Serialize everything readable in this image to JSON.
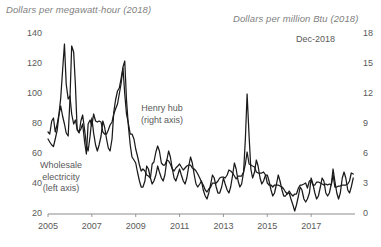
{
  "chart_data": {
    "type": "line",
    "title": "",
    "left_axis": {
      "label": "Dollars per megawatt-hour (2018)",
      "ticks": [
        20,
        40,
        60,
        80,
        100,
        120,
        140
      ],
      "ylim": [
        20,
        140
      ]
    },
    "right_axis": {
      "label": "Dollars per million Btu (2018)",
      "ticks": [
        0,
        3,
        6,
        9,
        12,
        15,
        18
      ],
      "ylim": [
        0,
        18
      ]
    },
    "xlabel": "",
    "x_ticks": [
      "2005",
      "2007",
      "2009",
      "2011",
      "2013",
      "2015",
      "2017"
    ],
    "xlim": [
      2005,
      2019
    ],
    "grid": false,
    "legend_position": "inline-annotations",
    "annotations": [
      {
        "name": "henry-hub",
        "line1": "Henry hub",
        "line2": "(right axis)"
      },
      {
        "name": "wholesale-electricity",
        "line1": "Wholesale",
        "line2": "electricity",
        "line3": "(left axis)"
      },
      {
        "name": "end-date-stamp",
        "text": "Dec-2018"
      }
    ],
    "series": [
      {
        "name": "Wholesale electricity",
        "axis": "left",
        "units": "Dollars per megawatt-hour (2018)",
        "color": "#1a1a1a",
        "x": [
          2005.0,
          2005.08,
          2005.17,
          2005.25,
          2005.33,
          2005.42,
          2005.5,
          2005.58,
          2005.67,
          2005.75,
          2005.83,
          2005.92,
          2006.0,
          2006.08,
          2006.17,
          2006.25,
          2006.33,
          2006.42,
          2006.5,
          2006.58,
          2006.67,
          2006.75,
          2006.83,
          2006.92,
          2007.0,
          2007.08,
          2007.17,
          2007.25,
          2007.33,
          2007.42,
          2007.5,
          2007.58,
          2007.67,
          2007.75,
          2007.83,
          2007.92,
          2008.0,
          2008.08,
          2008.17,
          2008.25,
          2008.33,
          2008.42,
          2008.5,
          2008.58,
          2008.67,
          2008.75,
          2008.83,
          2008.92,
          2009.0,
          2009.08,
          2009.17,
          2009.25,
          2009.33,
          2009.42,
          2009.5,
          2009.58,
          2009.67,
          2009.75,
          2009.83,
          2009.92,
          2010.0,
          2010.08,
          2010.17,
          2010.25,
          2010.33,
          2010.42,
          2010.5,
          2010.58,
          2010.67,
          2010.75,
          2010.83,
          2010.92,
          2011.0,
          2011.08,
          2011.17,
          2011.25,
          2011.33,
          2011.42,
          2011.5,
          2011.58,
          2011.67,
          2011.75,
          2011.83,
          2011.92,
          2012.0,
          2012.08,
          2012.17,
          2012.25,
          2012.33,
          2012.42,
          2012.5,
          2012.58,
          2012.67,
          2012.75,
          2012.83,
          2012.92,
          2013.0,
          2013.08,
          2013.17,
          2013.25,
          2013.33,
          2013.42,
          2013.5,
          2013.58,
          2013.67,
          2013.75,
          2013.83,
          2013.92,
          2014.0,
          2014.08,
          2014.17,
          2014.25,
          2014.33,
          2014.42,
          2014.5,
          2014.58,
          2014.67,
          2014.75,
          2014.83,
          2014.92,
          2015.0,
          2015.08,
          2015.17,
          2015.25,
          2015.33,
          2015.42,
          2015.5,
          2015.58,
          2015.67,
          2015.75,
          2015.83,
          2015.92,
          2016.0,
          2016.08,
          2016.17,
          2016.25,
          2016.33,
          2016.42,
          2016.5,
          2016.58,
          2016.67,
          2016.75,
          2016.83,
          2016.92,
          2017.0,
          2017.08,
          2017.17,
          2017.25,
          2017.33,
          2017.42,
          2017.5,
          2017.58,
          2017.67,
          2017.75,
          2017.83,
          2017.92,
          2018.0,
          2018.08,
          2018.17,
          2018.25,
          2018.33,
          2018.42,
          2018.5,
          2018.58,
          2018.67,
          2018.75,
          2018.83,
          2018.92
        ],
        "values": [
          70,
          68,
          66,
          65,
          70,
          76,
          86,
          92,
          85,
          80,
          74,
          72,
          96,
          132,
          128,
          106,
          76,
          74,
          82,
          86,
          76,
          66,
          62,
          72,
          84,
          74,
          66,
          62,
          66,
          72,
          82,
          78,
          70,
          64,
          62,
          70,
          88,
          96,
          102,
          104,
          110,
          118,
          122,
          96,
          78,
          66,
          58,
          56,
          54,
          48,
          42,
          38,
          38,
          42,
          52,
          50,
          44,
          40,
          42,
          46,
          52,
          48,
          44,
          42,
          46,
          56,
          62,
          58,
          50,
          44,
          42,
          46,
          50,
          46,
          42,
          40,
          44,
          52,
          58,
          54,
          46,
          40,
          38,
          40,
          42,
          36,
          32,
          30,
          34,
          40,
          46,
          44,
          38,
          34,
          34,
          38,
          44,
          40,
          36,
          34,
          38,
          46,
          54,
          50,
          42,
          38,
          40,
          48,
          70,
          100,
          72,
          50,
          44,
          48,
          56,
          52,
          44,
          40,
          42,
          46,
          46,
          42,
          36,
          32,
          34,
          40,
          46,
          42,
          36,
          32,
          32,
          34,
          34,
          30,
          26,
          22,
          26,
          32,
          38,
          36,
          30,
          28,
          30,
          34,
          44,
          40,
          34,
          30,
          32,
          38,
          44,
          42,
          34,
          32,
          34,
          40,
          50,
          42,
          34,
          30,
          34,
          44,
          48,
          44,
          36,
          34,
          38,
          44
        ]
      },
      {
        "name": "Henry hub",
        "axis": "right",
        "units": "Dollars per million Btu (2018)",
        "color": "#1a1a1a",
        "x": [
          2005.0,
          2005.08,
          2005.17,
          2005.25,
          2005.33,
          2005.42,
          2005.5,
          2005.58,
          2005.67,
          2005.75,
          2005.83,
          2005.92,
          2006.0,
          2006.08,
          2006.17,
          2006.25,
          2006.33,
          2006.42,
          2006.5,
          2006.58,
          2006.67,
          2006.75,
          2006.83,
          2006.92,
          2007.0,
          2007.08,
          2007.17,
          2007.25,
          2007.33,
          2007.42,
          2007.5,
          2007.58,
          2007.67,
          2007.75,
          2007.83,
          2007.92,
          2008.0,
          2008.08,
          2008.17,
          2008.25,
          2008.33,
          2008.42,
          2008.5,
          2008.58,
          2008.67,
          2008.75,
          2008.83,
          2008.92,
          2009.0,
          2009.08,
          2009.17,
          2009.25,
          2009.33,
          2009.42,
          2009.5,
          2009.58,
          2009.67,
          2009.75,
          2009.83,
          2009.92,
          2010.0,
          2010.08,
          2010.17,
          2010.25,
          2010.33,
          2010.42,
          2010.5,
          2010.58,
          2010.67,
          2010.75,
          2010.83,
          2010.92,
          2011.0,
          2011.08,
          2011.17,
          2011.25,
          2011.33,
          2011.42,
          2011.5,
          2011.58,
          2011.67,
          2011.75,
          2011.83,
          2011.92,
          2012.0,
          2012.08,
          2012.17,
          2012.25,
          2012.33,
          2012.42,
          2012.5,
          2012.58,
          2012.67,
          2012.75,
          2012.83,
          2012.92,
          2013.0,
          2013.08,
          2013.17,
          2013.25,
          2013.33,
          2013.42,
          2013.5,
          2013.58,
          2013.67,
          2013.75,
          2013.83,
          2013.92,
          2014.0,
          2014.08,
          2014.17,
          2014.25,
          2014.33,
          2014.42,
          2014.5,
          2014.58,
          2014.67,
          2014.75,
          2014.83,
          2014.92,
          2015.0,
          2015.08,
          2015.17,
          2015.25,
          2015.33,
          2015.42,
          2015.5,
          2015.58,
          2015.67,
          2015.75,
          2015.83,
          2015.92,
          2016.0,
          2016.08,
          2016.17,
          2016.25,
          2016.33,
          2016.42,
          2016.5,
          2016.58,
          2016.67,
          2016.75,
          2016.83,
          2016.92,
          2017.0,
          2017.08,
          2017.17,
          2017.25,
          2017.33,
          2017.42,
          2017.5,
          2017.58,
          2017.67,
          2017.75,
          2017.83,
          2017.92,
          2018.0,
          2018.08,
          2018.17,
          2018.25,
          2018.33,
          2018.42,
          2018.5,
          2018.58,
          2018.67,
          2018.75,
          2018.83,
          2018.92
        ],
        "values": [
          8.2,
          8.0,
          9.3,
          9.6,
          8.2,
          9.0,
          10.0,
          11.6,
          14.5,
          17.0,
          13.0,
          11.5,
          11.8,
          10.0,
          9.0,
          9.4,
          8.5,
          8.2,
          8.5,
          9.0,
          7.2,
          6.0,
          9.0,
          9.4,
          8.8,
          10.0,
          9.3,
          9.2,
          9.3,
          9.2,
          8.2,
          8.0,
          8.0,
          8.4,
          8.9,
          9.2,
          10.0,
          10.5,
          11.0,
          12.0,
          13.0,
          14.6,
          12.0,
          10.0,
          9.0,
          8.0,
          8.0,
          7.5,
          6.5,
          5.8,
          4.9,
          4.3,
          4.5,
          4.3,
          3.9,
          3.8,
          3.6,
          5.0,
          5.2,
          6.2,
          6.8,
          6.3,
          5.1,
          4.9,
          4.9,
          5.4,
          5.3,
          5.0,
          4.5,
          4.3,
          4.6,
          4.8,
          5.0,
          4.7,
          4.4,
          4.6,
          4.8,
          4.9,
          4.9,
          4.6,
          4.5,
          4.3,
          4.0,
          3.6,
          3.2,
          2.9,
          2.4,
          2.2,
          2.5,
          2.7,
          3.1,
          3.1,
          3.1,
          3.3,
          3.6,
          3.7,
          3.7,
          3.6,
          3.9,
          4.4,
          4.3,
          4.1,
          3.8,
          3.5,
          3.8,
          3.8,
          3.8,
          4.2,
          5.0,
          6.2,
          5.0,
          4.9,
          4.8,
          4.7,
          4.2,
          4.1,
          4.1,
          4.1,
          4.2,
          3.9,
          3.1,
          2.9,
          2.9,
          2.7,
          2.9,
          2.9,
          2.9,
          2.8,
          2.7,
          2.5,
          2.2,
          2.0,
          2.3,
          2.0,
          1.8,
          2.0,
          2.0,
          2.6,
          2.9,
          2.9,
          3.0,
          3.1,
          2.6,
          3.3,
          3.4,
          2.9,
          2.9,
          3.2,
          3.2,
          3.1,
          3.0,
          2.9,
          3.0,
          2.9,
          3.0,
          2.9,
          3.9,
          2.7,
          2.7,
          2.8,
          2.8,
          2.9,
          2.9,
          2.9,
          3.0,
          3.3,
          4.1,
          4.0
        ]
      }
    ]
  }
}
